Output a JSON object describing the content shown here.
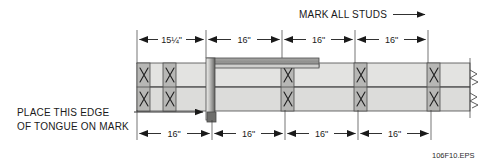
{
  "figure": {
    "id_label": "106F10.EPS"
  },
  "notes": {
    "top": {
      "text": "MARK ALL STUDS",
      "arrow": "arrow-right"
    },
    "left": {
      "line1": "PLACE THIS EDGE",
      "line2": "OF TONGUE ON MARK",
      "arrow": "arrow-right"
    }
  },
  "dimensions": {
    "top_row": [
      {
        "label": "15¼\"",
        "x_start": 137,
        "x_end": 206
      },
      {
        "label": "16\"",
        "x_start": 206,
        "x_end": 282
      },
      {
        "label": "16\"",
        "x_start": 282,
        "x_end": 355
      },
      {
        "label": "16\"",
        "x_start": 355,
        "x_end": 428
      }
    ],
    "bottom_row": [
      {
        "label": "16\"",
        "x_start": 137,
        "x_end": 212
      },
      {
        "label": "16\"",
        "x_start": 212,
        "x_end": 285
      },
      {
        "label": "16\"",
        "x_start": 285,
        "x_end": 358
      },
      {
        "label": "16\"",
        "x_start": 358,
        "x_end": 431
      }
    ]
  },
  "studs": [
    {
      "name": "stud-1",
      "x": 137,
      "width": 13,
      "mark": "X"
    },
    {
      "name": "stud-2",
      "x": 163,
      "width": 13,
      "mark": "X"
    },
    {
      "name": "stud-3",
      "x": 281,
      "width": 13,
      "mark": "X"
    },
    {
      "name": "stud-4",
      "x": 354,
      "width": 13,
      "mark": "X"
    },
    {
      "name": "stud-5",
      "x": 427,
      "width": 13,
      "mark": "X"
    }
  ],
  "plates": {
    "top_plate": {
      "y": 63,
      "height": 24
    },
    "bottom_plate": {
      "y": 87,
      "height": 24
    },
    "x_left": 137,
    "x_right": 470
  },
  "tape_measure": {
    "body": {
      "x": 207,
      "y": 58,
      "width": 112,
      "height": 8
    },
    "blade": {
      "x": 211,
      "y": 64,
      "width": 108,
      "height": 4
    },
    "tongue": {
      "x": 206,
      "y": 58,
      "width": 8,
      "height": 62
    },
    "hook": {
      "x": 207,
      "y": 113,
      "width": 8,
      "height": 9
    }
  },
  "colors": {
    "board_fill": "#e3e3e1",
    "board_fill_alt": "#dcdcda",
    "stud_fill": "#b7b7b5",
    "tape_fill": "#c8c8c6",
    "tape_dark": "#6e6e6c",
    "outline": "#4a4a4a",
    "ink": "#1a1a1a",
    "thin_rule": "#3a3a3a",
    "background": "#ffffff"
  }
}
